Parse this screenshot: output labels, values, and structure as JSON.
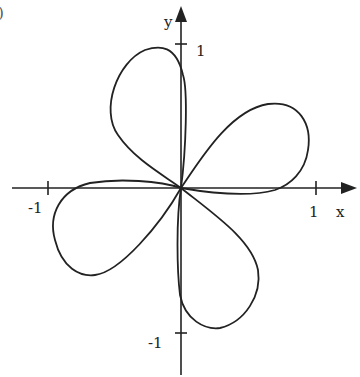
{
  "figure": {
    "corner_label_fragment": ")",
    "axes": {
      "x_label": "x",
      "y_label": "y",
      "x_ticks": [
        {
          "value": -1,
          "label": "-1"
        },
        {
          "value": 1,
          "label": "1"
        }
      ],
      "y_ticks": [
        {
          "value": 1,
          "label": "1"
        },
        {
          "value": -1,
          "label": "-1"
        }
      ]
    },
    "curve": {
      "description": "Four-petal pinwheel-shaped closed curve passing through the origin",
      "petals": [
        {
          "name": "upper",
          "tip_approx": [
            -0.3,
            0.95
          ]
        },
        {
          "name": "right",
          "tip_approx": [
            0.95,
            0.45
          ]
        },
        {
          "name": "left",
          "tip_approx": [
            -0.95,
            -0.3
          ]
        },
        {
          "name": "lower",
          "tip_approx": [
            0.3,
            -0.95
          ]
        }
      ]
    },
    "colors": {
      "ink": "#222222",
      "background": "#ffffff"
    }
  }
}
